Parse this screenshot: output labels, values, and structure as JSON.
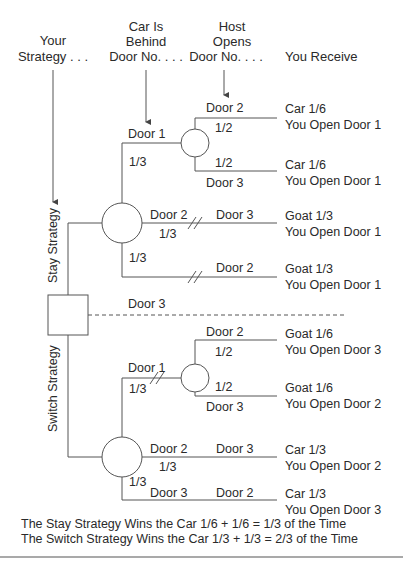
{
  "colors": {
    "line": "#555555",
    "text": "#2a2a2a",
    "background": "#ffffff"
  },
  "headers": {
    "your_strategy": [
      "Your",
      "Strategy . . ."
    ],
    "car_behind": [
      "Car Is",
      "Behind",
      "Door No. . . ."
    ],
    "host_opens": [
      "Host",
      "Opens",
      "Door No. . . ."
    ],
    "you_receive": "You Receive"
  },
  "strategies": {
    "stay_label": "Stay Strategy",
    "switch_label": "Switch Strategy",
    "decision_door": "Door 3"
  },
  "stay_branch": {
    "door1": {
      "label": "Door 1",
      "prob": "1/3",
      "host_upper": {
        "label": "Door 2",
        "prob": "1/2",
        "outcome": "Car 1/6",
        "action": "You Open Door 1"
      },
      "host_lower": {
        "label": "Door 3",
        "prob": "1/2",
        "outcome": "Car 1/6",
        "action": "You Open Door 1"
      }
    },
    "door2": {
      "label": "Door 2",
      "prob": "1/3",
      "host": "Door 3",
      "outcome": "Goat 1/3",
      "action": "You Open Door 1"
    },
    "door3": {
      "prob": "1/3",
      "host": "Door 2",
      "outcome": "Goat 1/3",
      "action": "You Open Door 1"
    }
  },
  "switch_branch": {
    "door1": {
      "label": "Door 1",
      "prob": "1/3",
      "host_upper": {
        "label": "Door 2",
        "prob": "1/2",
        "outcome": "Goat 1/6",
        "action": "You Open Door 3"
      },
      "host_lower": {
        "label": "Door 3",
        "prob": "1/2",
        "outcome": "Goat 1/6",
        "action": "You Open Door 2"
      }
    },
    "door2": {
      "label": "Door 2",
      "prob": "1/3",
      "host": "Door 3",
      "outcome": "Car 1/3",
      "action": "You Open Door 2"
    },
    "door3": {
      "label": "Door 3",
      "prob": "1/3",
      "host": "Door 2",
      "outcome": "Car 1/3",
      "action": "You Open Door 3"
    }
  },
  "summary": {
    "stay": "The Stay Strategy Wins the Car 1/6 + 1/6 = 1/3 of the Time",
    "switch": "The Switch Strategy Wins the Car 1/3 + 1/3 = 2/3 of the Time"
  }
}
